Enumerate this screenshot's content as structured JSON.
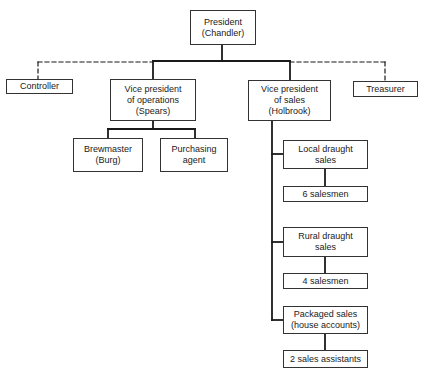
{
  "chart": {
    "nodes": [
      {
        "id": "president",
        "label": "President\n(Chandler)",
        "x": 190,
        "y": 10,
        "w": 66,
        "h": 35
      },
      {
        "id": "controller",
        "label": "Controller",
        "x": 6,
        "y": 79,
        "w": 67,
        "h": 15
      },
      {
        "id": "vp-operations",
        "label": "Vice president\nof operations\n(Spears)",
        "x": 110,
        "y": 79,
        "w": 86,
        "h": 42
      },
      {
        "id": "vp-sales",
        "label": "Vice president\nof sales\n(Holbrook)",
        "x": 248,
        "y": 80,
        "w": 83,
        "h": 41
      },
      {
        "id": "treasurer",
        "label": "Treasurer",
        "x": 353,
        "y": 81,
        "w": 65,
        "h": 16
      },
      {
        "id": "brewmaster",
        "label": "Brewmaster\n(Burg)",
        "x": 73,
        "y": 138,
        "w": 70,
        "h": 34
      },
      {
        "id": "purchasing-agent",
        "label": "Purchasing\nagent",
        "x": 160,
        "y": 138,
        "w": 68,
        "h": 34
      },
      {
        "id": "local-draught-sales",
        "label": "Local draught\nsales",
        "x": 283,
        "y": 140,
        "w": 85,
        "h": 29
      },
      {
        "id": "six-salesmen",
        "label": "6 salesmen",
        "x": 283,
        "y": 186,
        "w": 85,
        "h": 16
      },
      {
        "id": "rural-draught-sales",
        "label": "Rural draught\nsales",
        "x": 283,
        "y": 227,
        "w": 85,
        "h": 30
      },
      {
        "id": "four-salesmen",
        "label": "4 salesmen",
        "x": 283,
        "y": 273,
        "w": 85,
        "h": 16
      },
      {
        "id": "packaged-sales",
        "label": "Packaged sales\n(house accounts)",
        "x": 283,
        "y": 306,
        "w": 85,
        "h": 28
      },
      {
        "id": "two-sales-assistants",
        "label": "2 sales assistants",
        "x": 283,
        "y": 350,
        "w": 85,
        "h": 18
      }
    ],
    "solid_edges": [
      [
        [
          222,
          45
        ],
        [
          222,
          61
        ]
      ],
      [
        [
          153,
          61
        ],
        [
          290,
          61
        ]
      ],
      [
        [
          153,
          61
        ],
        [
          153,
          79
        ]
      ],
      [
        [
          290,
          61
        ],
        [
          290,
          80
        ]
      ],
      [
        [
          153,
          121
        ],
        [
          153,
          129
        ]
      ],
      [
        [
          108,
          129
        ],
        [
          195,
          129
        ]
      ],
      [
        [
          108,
          129
        ],
        [
          108,
          138
        ]
      ],
      [
        [
          195,
          129
        ],
        [
          195,
          138
        ]
      ],
      [
        [
          272,
          121
        ],
        [
          272,
          320
        ]
      ],
      [
        [
          272,
          154
        ],
        [
          283,
          154
        ]
      ],
      [
        [
          272,
          242
        ],
        [
          283,
          242
        ]
      ],
      [
        [
          272,
          320
        ],
        [
          283,
          320
        ]
      ],
      [
        [
          325,
          169
        ],
        [
          325,
          186
        ]
      ],
      [
        [
          325,
          257
        ],
        [
          325,
          273
        ]
      ],
      [
        [
          325,
          334
        ],
        [
          325,
          350
        ]
      ]
    ],
    "dashed_edges": [
      [
        [
          38,
          62
        ],
        [
          153,
          62
        ]
      ],
      [
        [
          38,
          62
        ],
        [
          38,
          79
        ]
      ],
      [
        [
          290,
          62
        ],
        [
          385,
          62
        ]
      ],
      [
        [
          385,
          62
        ],
        [
          385,
          81
        ]
      ]
    ],
    "line_color": "#1a1a1a"
  }
}
